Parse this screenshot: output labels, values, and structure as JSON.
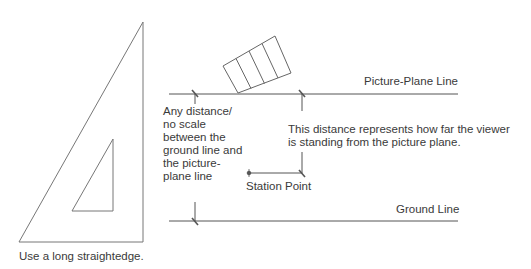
{
  "diagram": {
    "labels": {
      "picture_plane_line": "Picture-Plane Line",
      "ground_line": "Ground Line",
      "station_point": "Station Point",
      "any_distance": "Any distance/\nno scale\nbetween the\nground line and\nthe picture-\nplane line",
      "viewer_distance": "This distance represents how far the viewer\nis standing from the picture plane.",
      "straightedge_caption": "Use a long straightedge."
    },
    "elements": {
      "triangle_tool": "30-60 drafting triangle",
      "object": "rectangular box (plan view) with 4 sections",
      "station_point_marker": "station-point dot"
    },
    "colors": {
      "line": "#555555",
      "text": "#3a3a3a"
    }
  }
}
